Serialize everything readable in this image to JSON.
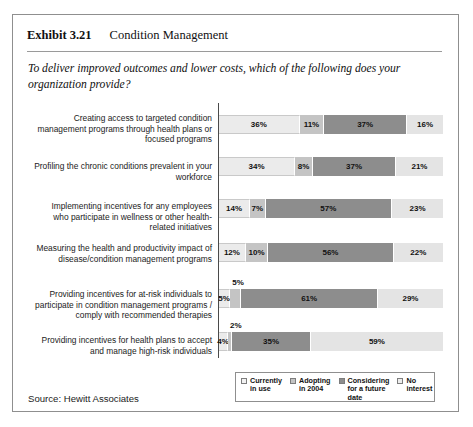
{
  "exhibit": {
    "number": "Exhibit 3.21",
    "title": "Condition Management"
  },
  "question": "To deliver improved outcomes and lower costs, which of the following does your organization provide?",
  "source": "Source: Hewitt Associates",
  "legend": {
    "items": [
      {
        "label": "Currently in use",
        "swatch": "legend-swatch-currently-in-use",
        "color": "#f2f2f2"
      },
      {
        "label": "Adopting in 2004",
        "swatch": "legend-swatch-adopting-2004",
        "color": "#c4c4c4"
      },
      {
        "label": "Considering for a future date",
        "swatch": "legend-swatch-considering",
        "color": "#8d8d8d"
      },
      {
        "label": "No interest",
        "swatch": "legend-swatch-no-interest",
        "color": "#ededed"
      }
    ]
  },
  "chart_data": {
    "type": "bar",
    "orientation": "horizontal",
    "stacked": true,
    "title": "Condition Management",
    "subtitle": "To deliver improved outcomes and lower costs, which of the following does your organization provide?",
    "xlabel": "",
    "ylabel": "",
    "xlim": [
      0,
      100
    ],
    "unit": "percent",
    "grid": false,
    "legend_position": "bottom-right",
    "categories": [
      "Creating access to targeted condition management programs through health plans or focused programs",
      "Profiling the chronic conditions prevalent in your workforce",
      "Implementing incentives for any employees who participate in wellness or other health-related initiatives",
      "Measuring the health and productivity impact of disease/condition management programs",
      "Providing incentives for at-risk individuals to participate in condition management programs / comply with recommended therapies",
      "Providing incentives for health plans to accept and manage high-risk individuals"
    ],
    "series": [
      {
        "name": "Currently in use",
        "values": [
          36,
          34,
          14,
          12,
          5,
          4
        ]
      },
      {
        "name": "Adopting in 2004",
        "values": [
          11,
          8,
          7,
          10,
          5,
          2
        ]
      },
      {
        "name": "Considering for a future date",
        "values": [
          37,
          37,
          57,
          56,
          61,
          35
        ]
      },
      {
        "name": "No interest",
        "values": [
          16,
          21,
          23,
          22,
          29,
          59
        ]
      }
    ]
  },
  "rows": [
    {
      "label": "Creating access to targeted condition management programs through health plans or focused programs",
      "segments": [
        {
          "name": "currently-in-use",
          "value": 36,
          "text": "36%",
          "callout": false
        },
        {
          "name": "adopting-2004",
          "value": 11,
          "text": "11%",
          "callout": false
        },
        {
          "name": "considering",
          "value": 37,
          "text": "37%",
          "callout": false
        },
        {
          "name": "no-interest",
          "value": 16,
          "text": "16%",
          "callout": false
        }
      ]
    },
    {
      "label": "Profiling the chronic conditions prevalent in your workforce",
      "segments": [
        {
          "name": "currently-in-use",
          "value": 34,
          "text": "34%",
          "callout": false
        },
        {
          "name": "adopting-2004",
          "value": 8,
          "text": "8%",
          "callout": false
        },
        {
          "name": "considering",
          "value": 37,
          "text": "37%",
          "callout": false
        },
        {
          "name": "no-interest",
          "value": 21,
          "text": "21%",
          "callout": false
        }
      ]
    },
    {
      "label": "Implementing incentives for any employees who participate in wellness or other health-related initiatives",
      "segments": [
        {
          "name": "currently-in-use",
          "value": 14,
          "text": "14%",
          "callout": false
        },
        {
          "name": "adopting-2004",
          "value": 7,
          "text": "7%",
          "callout": false
        },
        {
          "name": "considering",
          "value": 57,
          "text": "57%",
          "callout": false
        },
        {
          "name": "no-interest",
          "value": 23,
          "text": "23%",
          "callout": false
        }
      ]
    },
    {
      "label": "Measuring the health and productivity impact of disease/condition management programs",
      "segments": [
        {
          "name": "currently-in-use",
          "value": 12,
          "text": "12%",
          "callout": false
        },
        {
          "name": "adopting-2004",
          "value": 10,
          "text": "10%",
          "callout": false
        },
        {
          "name": "considering",
          "value": 56,
          "text": "56%",
          "callout": false
        },
        {
          "name": "no-interest",
          "value": 22,
          "text": "22%",
          "callout": false
        }
      ]
    },
    {
      "label": "Providing incentives for at-risk individuals to participate in condition management programs / comply with recommended therapies",
      "segments": [
        {
          "name": "currently-in-use",
          "value": 5,
          "text": "5%",
          "callout": false
        },
        {
          "name": "adopting-2004",
          "value": 5,
          "text": "5%",
          "callout": true
        },
        {
          "name": "considering",
          "value": 61,
          "text": "61%",
          "callout": false
        },
        {
          "name": "no-interest",
          "value": 29,
          "text": "29%",
          "callout": false
        }
      ]
    },
    {
      "label": "Providing incentives for health plans to accept and manage high-risk individuals",
      "segments": [
        {
          "name": "currently-in-use",
          "value": 4,
          "text": "4%",
          "callout": false
        },
        {
          "name": "adopting-2004",
          "value": 2,
          "text": "2%",
          "callout": true
        },
        {
          "name": "considering",
          "value": 35,
          "text": "35%",
          "callout": false
        },
        {
          "name": "no-interest",
          "value": 59,
          "text": "59%",
          "callout": false
        }
      ]
    }
  ]
}
